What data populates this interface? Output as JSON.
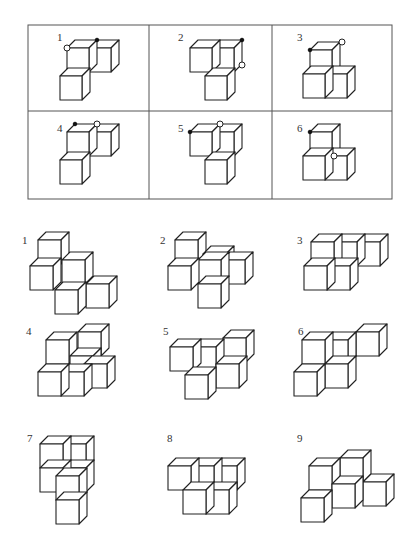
{
  "reference_table": {
    "frame": {
      "x": 28,
      "y": 25,
      "w": 364,
      "h": 174
    },
    "dividers_x": [
      149,
      272
    ],
    "divider_y": 111,
    "cells": [
      {
        "label": "1",
        "label_pos": [
          57,
          41
        ],
        "cube": {
          "s": 22,
          "h": 24,
          "d": 8
        },
        "cubes": [
          [
            67,
            48,
            0
          ],
          [
            89,
            48,
            0
          ],
          [
            60,
            76,
            1
          ]
        ],
        "open_dots": [
          [
            67,
            48
          ]
        ],
        "filled_dots": [
          [
            97,
            40
          ]
        ]
      },
      {
        "label": "2",
        "label_pos": [
          178,
          41
        ],
        "cube": {
          "s": 22,
          "h": 24,
          "d": 8
        },
        "cubes": [
          [
            190,
            48,
            0
          ],
          [
            212,
            48,
            0
          ],
          [
            205,
            76,
            1
          ]
        ],
        "open_dots": [
          [
            242,
            65
          ]
        ],
        "filled_dots": [
          [
            242,
            40
          ]
        ]
      },
      {
        "label": "3",
        "label_pos": [
          297,
          41
        ],
        "cube": {
          "s": 22,
          "h": 24,
          "d": 8
        },
        "cubes": [
          [
            310,
            50,
            0
          ],
          [
            303,
            74,
            1
          ],
          [
            325,
            74,
            0
          ]
        ],
        "open_dots": [
          [
            342,
            42
          ]
        ],
        "filled_dots": [
          [
            310,
            50
          ]
        ]
      },
      {
        "label": "4",
        "label_pos": [
          57,
          132
        ],
        "cube": {
          "s": 22,
          "h": 24,
          "d": 8
        },
        "cubes": [
          [
            67,
            132,
            0
          ],
          [
            89,
            132,
            0
          ],
          [
            60,
            160,
            1
          ]
        ],
        "open_dots": [
          [
            97,
            124
          ]
        ],
        "filled_dots": [
          [
            75,
            124
          ]
        ]
      },
      {
        "label": "5",
        "label_pos": [
          178,
          132
        ],
        "cube": {
          "s": 22,
          "h": 24,
          "d": 8
        },
        "cubes": [
          [
            190,
            132,
            0
          ],
          [
            212,
            132,
            0
          ],
          [
            205,
            160,
            1
          ]
        ],
        "open_dots": [
          [
            220,
            124
          ]
        ],
        "filled_dots": [
          [
            190,
            132
          ]
        ]
      },
      {
        "label": "6",
        "label_pos": [
          297,
          132
        ],
        "cube": {
          "s": 22,
          "h": 24,
          "d": 8
        },
        "cubes": [
          [
            310,
            132,
            0
          ],
          [
            303,
            156,
            1
          ],
          [
            325,
            156,
            0
          ]
        ],
        "open_dots": [
          [
            334,
            156
          ]
        ],
        "filled_dots": [
          [
            310,
            132
          ]
        ]
      }
    ]
  },
  "options": [
    {
      "label": "1",
      "label_pos": [
        22,
        244
      ],
      "cube": {
        "s": 23,
        "h": 24,
        "d": 8
      },
      "cubes": [
        [
          38,
          240
        ],
        [
          30,
          266
        ],
        [
          62,
          260
        ],
        [
          55,
          290
        ],
        [
          86,
          284
        ]
      ]
    },
    {
      "label": "2",
      "label_pos": [
        160,
        244
      ],
      "cube": {
        "s": 23,
        "h": 24,
        "d": 8
      },
      "cubes": [
        [
          175,
          240
        ],
        [
          203,
          254
        ],
        [
          168,
          266
        ],
        [
          222,
          260
        ],
        [
          198,
          284
        ],
        [
          198,
          260
        ]
      ]
    },
    {
      "label": "3",
      "label_pos": [
        297,
        244
      ],
      "cube": {
        "s": 23,
        "h": 24,
        "d": 8
      },
      "cubes": [
        [
          311,
          242
        ],
        [
          334,
          242
        ],
        [
          357,
          242
        ],
        [
          304,
          266
        ],
        [
          327,
          266
        ]
      ]
    },
    {
      "label": "4",
      "label_pos": [
        26,
        335
      ],
      "cube": {
        "s": 23,
        "h": 24,
        "d": 8
      },
      "cubes": [
        [
          78,
          332
        ],
        [
          46,
          340
        ],
        [
          70,
          356
        ],
        [
          38,
          372
        ],
        [
          61,
          372
        ],
        [
          84,
          364
        ]
      ]
    },
    {
      "label": "5",
      "label_pos": [
        163,
        335
      ],
      "cube": {
        "s": 23,
        "h": 24,
        "d": 8
      },
      "cubes": [
        [
          223,
          338
        ],
        [
          170,
          347
        ],
        [
          193,
          347
        ],
        [
          216,
          364
        ],
        [
          185,
          375
        ]
      ]
    },
    {
      "label": "6",
      "label_pos": [
        298,
        335
      ],
      "cube": {
        "s": 23,
        "h": 24,
        "d": 8
      },
      "cubes": [
        [
          302,
          340
        ],
        [
          325,
          340
        ],
        [
          356,
          332
        ],
        [
          325,
          364
        ],
        [
          294,
          372
        ]
      ]
    },
    {
      "label": "7",
      "label_pos": [
        27,
        442
      ],
      "cube": {
        "s": 23,
        "h": 24,
        "d": 8
      },
      "cubes": [
        [
          40,
          444
        ],
        [
          63,
          444
        ],
        [
          63,
          468
        ],
        [
          56,
          476
        ],
        [
          56,
          500
        ],
        [
          40,
          468
        ]
      ]
    },
    {
      "label": "8",
      "label_pos": [
        167,
        442
      ],
      "cube": {
        "s": 23,
        "h": 24,
        "d": 8
      },
      "cubes": [
        [
          168,
          466
        ],
        [
          191,
          466
        ],
        [
          214,
          466
        ],
        [
          183,
          490
        ],
        [
          206,
          490
        ]
      ]
    },
    {
      "label": "9",
      "label_pos": [
        297,
        442
      ],
      "cube": {
        "s": 23,
        "h": 24,
        "d": 8
      },
      "cubes": [
        [
          340,
          458
        ],
        [
          309,
          466
        ],
        [
          363,
          482
        ],
        [
          332,
          484
        ],
        [
          301,
          498
        ]
      ]
    }
  ]
}
